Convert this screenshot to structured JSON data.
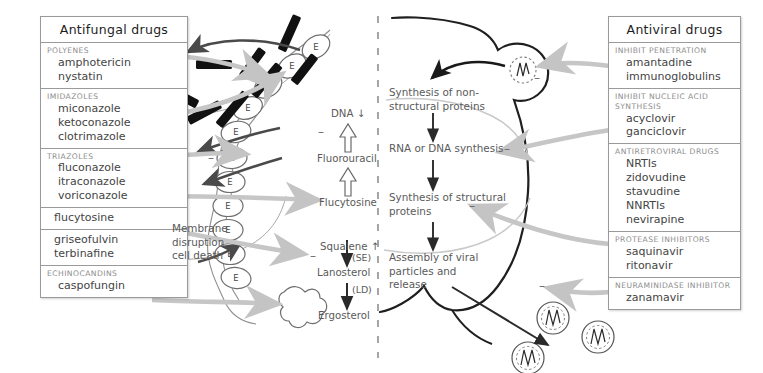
{
  "figure": {
    "divider": "vertical-dashed-line",
    "colors": {
      "ink": "#3a3a3a",
      "category_text": "#8d8d8d",
      "box_border": "#9a9a9a",
      "gray_arrow": "#c6c6c6",
      "dark_arrow": "#4a4a4a",
      "black_bar": "#111111",
      "background": "#ffffff"
    }
  },
  "antifungal_panel": {
    "title": "Antifungal drugs",
    "groups": [
      {
        "category": "POLYENES",
        "drugs": [
          "amphotericin",
          "nystatin"
        ]
      },
      {
        "category": "IMIDAZOLES",
        "drugs": [
          "miconazole",
          "ketoconazole",
          "clotrimazole"
        ]
      },
      {
        "category": "TRIAZOLES",
        "drugs": [
          "fluconazole",
          "itraconazole",
          "voriconazole"
        ]
      },
      {
        "category": "",
        "drugs": [
          "flucytosine"
        ]
      },
      {
        "category": "",
        "drugs": [
          "griseofulvin",
          "terbinafine"
        ]
      },
      {
        "category": "ECHINOCANDINS",
        "drugs": [
          "caspofungin"
        ]
      }
    ]
  },
  "antiviral_panel": {
    "title": "Antiviral drugs",
    "groups": [
      {
        "category": "INHIBIT PENETRATION",
        "drugs": [
          "amantadine",
          "immunoglobulins"
        ]
      },
      {
        "category": "INHIBIT NUCLEIC ACID\nSYNTHESIS",
        "drugs": [
          "acyclovir",
          "ganciclovir"
        ]
      },
      {
        "category": "ANTIRETROVIRAL DRUGS",
        "drugs": [
          "NRTIs",
          "zidovudine",
          "stavudine",
          "NNRTIs",
          "nevirapine"
        ]
      },
      {
        "category": "PROTEASE INHIBITORS",
        "drugs": [
          "saquinavir",
          "ritonavir"
        ]
      },
      {
        "category": "NEURAMINIDASE\nINHIBITOR",
        "drugs": [
          "zanamavir"
        ]
      }
    ]
  },
  "fungal_pathway": {
    "membrane_note": "Membrane\ndisruption\ncell death",
    "sterol_marker": "E",
    "steps": [
      {
        "label": "DNA ↓",
        "id": "dna"
      },
      {
        "label": "Fluorouracil",
        "id": "fluorouracil"
      },
      {
        "label": "Flucytosine",
        "id": "flucytosine"
      },
      {
        "label": "Squalene ↑",
        "id": "squalene"
      },
      {
        "label": "(SE)",
        "id": "squalene-epoxidase"
      },
      {
        "label": "Lanosterol",
        "id": "lanosterol"
      },
      {
        "label": "(LD)",
        "id": "lanosterol-demethylase"
      },
      {
        "label": "Ergosterol",
        "id": "ergosterol"
      }
    ],
    "inhibition_marks": [
      "–",
      "–",
      "–"
    ]
  },
  "viral_pathway": {
    "steps": [
      {
        "label": "Synthesis of non-\nstructural proteins",
        "id": "nonstructural-proteins"
      },
      {
        "label": "RNA or DNA synthesis",
        "id": "nucleic-acid-synthesis"
      },
      {
        "label": "Synthesis of structural\nproteins",
        "id": "structural-proteins"
      },
      {
        "label": "Assembly of viral\nparticles and\nrelease",
        "id": "assembly-release"
      }
    ],
    "inhibition_marks": [
      "–",
      "–",
      "–",
      "–"
    ]
  }
}
